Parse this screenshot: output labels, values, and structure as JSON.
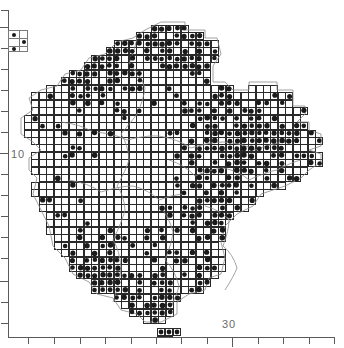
{
  "figure": {
    "kind": "atlas-distribution-map",
    "background": "#ffffff",
    "ink": "#1a1a1a",
    "axis_color": "#5a5a5a",
    "grid_color": "#2a2a2a",
    "coast_color": "#8a8a8a"
  },
  "axes": {
    "y": {
      "labels": [
        {
          "text": "10",
          "value": 10,
          "y_px": 153
        }
      ],
      "major_ticks_px": [
        27,
        153,
        281
      ],
      "minor_ticks_px": [
        10,
        48,
        69,
        90,
        111,
        132,
        174,
        195,
        216,
        237,
        258,
        302,
        323
      ],
      "line": {
        "x_px": 8,
        "y0_px": 10,
        "y1_px": 338
      }
    },
    "x": {
      "labels": [
        {
          "text": "30",
          "value": 30,
          "x_px": 232
        }
      ],
      "major_ticks_px": [
        232
      ],
      "minor_ticks_px": [
        28,
        54,
        80,
        105,
        131,
        156,
        181,
        207,
        258,
        283,
        309,
        334
      ],
      "line": {
        "y_px": 337,
        "x0_px": 8,
        "x1_px": 335
      }
    }
  },
  "legend": {
    "name": "grid-scale-key",
    "box_px": {
      "x": 8,
      "y": 30,
      "w": 20,
      "h": 22
    },
    "columns": 2,
    "rows": 3,
    "filled_cells": [
      [
        0,
        0
      ],
      [
        1,
        1
      ],
      [
        0,
        2
      ]
    ]
  },
  "chart_data": {
    "type": "scatter",
    "title": "",
    "xlabel": "",
    "ylabel": "",
    "grid": true,
    "legend_position": "top-left",
    "xlim": [
      20,
      42
    ],
    "ylim": [
      4,
      24
    ],
    "cell_size_px": 7.47
  }
}
